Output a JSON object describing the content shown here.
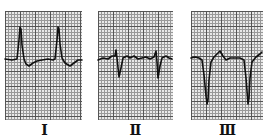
{
  "figure": {
    "type": "ECG limb leads",
    "leads": [
      {
        "id": "lead-1",
        "label": "Ⅰ",
        "panel": {
          "x": 5,
          "w": 77
        },
        "path": "M5,59 L12,60 L17,59 L19,40 L20,27 L21,29 L22,45 L24,59 L26,64 L29,66 L33,63 L37,61 L42,60 L48,59 L53,60 L55,59 L57,40 L58,27 L59,29 L60,44 L62,58 L65,63 L70,66 L74,63 L78,60 L82,60"
      },
      {
        "id": "lead-2",
        "label": "Ⅱ",
        "panel": {
          "x": 98,
          "w": 75
        },
        "path": "M98,60 L103,58 L108,59 L112,56 L115,56 L116,50 L117,58 L119,77 L121,68 L123,58 L127,56 L130,58 L134,56 L138,59 L142,58 L146,57 L150,59 L154,57 L156,51 L157,62 L158,78 L160,66 L162,58 L166,56 L169,58 L172,59"
      },
      {
        "id": "lead-3",
        "label": "Ⅲ",
        "panel": {
          "x": 191,
          "w": 72
        },
        "path": "M191,58 L195,57 L199,58 L202,60 L204,75 L206,96 L207,104 L208,100 L209,80 L211,62 L214,57 L218,53 L220,51 L223,56 L226,60 L230,58 L235,58 L240,58 L244,60 L246,78 L248,104 L249,98 L250,78 L252,62 L256,57 L260,54 L262,52"
      }
    ]
  },
  "colors": {
    "grid_major": "#555555",
    "grid_minor": "#999999",
    "paper": "#e9e9e9",
    "trace": "#111111"
  }
}
